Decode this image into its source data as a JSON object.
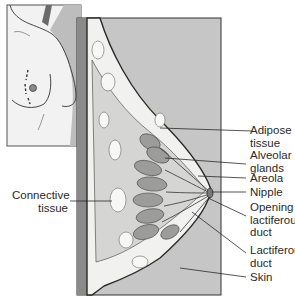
{
  "figure": {
    "inset": {
      "description": "Front view of torso with dashed line indicating section plane"
    },
    "colors": {
      "panel_bg": "#c6c6c6",
      "inset_bg": "#f2f2f2",
      "inset_shade": "#bdbdbd",
      "adipose": "#f1f1ef",
      "connective": "#d5d5d3",
      "gland": "#9c9c9a",
      "chest_wall": "#8a8a8a",
      "line": "#2a2a2a"
    }
  },
  "labels": {
    "adipose_tissue": {
      "line1": "Adipose",
      "line2": "tissue"
    },
    "alveolar_glands": {
      "line1": "Alveolar",
      "line2": "glands"
    },
    "areola": {
      "line1": "Areola"
    },
    "nipple": {
      "line1": "Nipple"
    },
    "opening_of_lactiferous_duct": {
      "line1": "Opening of",
      "line2": "lactiferous",
      "line3": "duct"
    },
    "lactiferous_duct": {
      "line1": "Lactiferous",
      "line2": "duct"
    },
    "skin": {
      "line1": "Skin"
    },
    "connective_tissue": {
      "line1": "Connective",
      "line2": "tissue"
    }
  }
}
